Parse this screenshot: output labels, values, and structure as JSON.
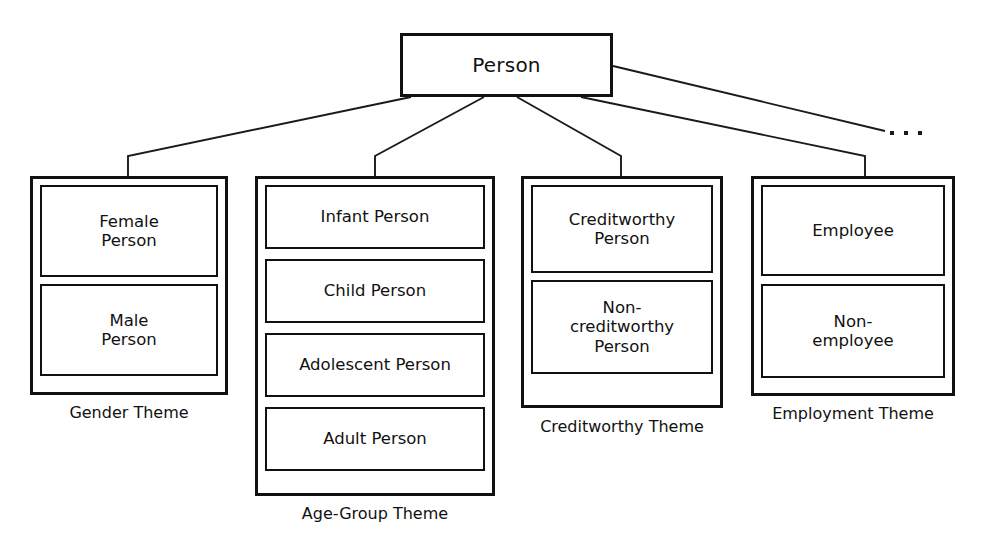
{
  "diagram": {
    "title_node": {
      "label": "Person"
    },
    "ellipsis": {
      "label": "...",
      "dot_count": 3
    },
    "themes": [
      {
        "id": "gender",
        "label": "Gender Theme",
        "concepts": [
          {
            "label": "Female\nPerson"
          },
          {
            "label": "Male\nPerson"
          }
        ]
      },
      {
        "id": "age-group",
        "label": "Age-Group Theme",
        "concepts": [
          {
            "label": "Infant Person"
          },
          {
            "label": "Child Person"
          },
          {
            "label": "Adolescent Person"
          },
          {
            "label": "Adult Person"
          }
        ]
      },
      {
        "id": "creditworthy",
        "label": "Creditworthy Theme",
        "concepts": [
          {
            "label": "Creditworthy\nPerson"
          },
          {
            "label": "Non-\ncreditworthy\nPerson"
          }
        ]
      },
      {
        "id": "employment",
        "label": "Employment Theme",
        "concepts": [
          {
            "label": "Employee"
          },
          {
            "label": "Non-\nemployee"
          }
        ]
      }
    ],
    "colors": {
      "stroke": "#111111",
      "background": "#ffffff",
      "text": "#111111"
    }
  }
}
